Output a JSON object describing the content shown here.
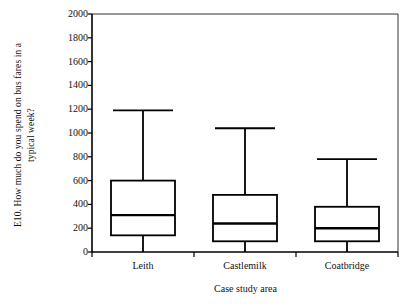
{
  "chart_data": {
    "type": "box",
    "title": "",
    "subtitle": "",
    "xlabel": "Case study area",
    "ylabel": "E10. How much do you spend on bus fares in a typical week?",
    "ylabel_line1": "E10. How much do you spend on bus fares in a",
    "ylabel_line2": "typical week?",
    "categories": [
      "Leith",
      "Castlemilk",
      "Coatbridge"
    ],
    "ylim": [
      0,
      2000
    ],
    "ytick_labels": [
      "2000",
      "1800",
      "1600",
      "1400",
      "1200",
      "1000",
      "800",
      "600",
      "400",
      "200",
      "0"
    ],
    "ytick_values": [
      2000,
      1800,
      1600,
      1400,
      1200,
      1000,
      800,
      600,
      400,
      200,
      0
    ],
    "ytick_step": 200,
    "grid": false,
    "legend": "none",
    "boxes": [
      {
        "category": "Leith",
        "whisker_low": 0,
        "q1": 140,
        "median": 310,
        "q3": 600,
        "whisker_high": 1190
      },
      {
        "category": "Castlemilk",
        "whisker_low": 0,
        "q1": 90,
        "median": 240,
        "q3": 480,
        "whisker_high": 1040
      },
      {
        "category": "Coatbridge",
        "whisker_low": 0,
        "q1": 90,
        "median": 200,
        "q3": 380,
        "whisker_high": 780
      }
    ],
    "colors": {
      "line": "#000000",
      "box_fill": "#ffffff",
      "background": "#ffffff",
      "frame": "#333333"
    }
  }
}
